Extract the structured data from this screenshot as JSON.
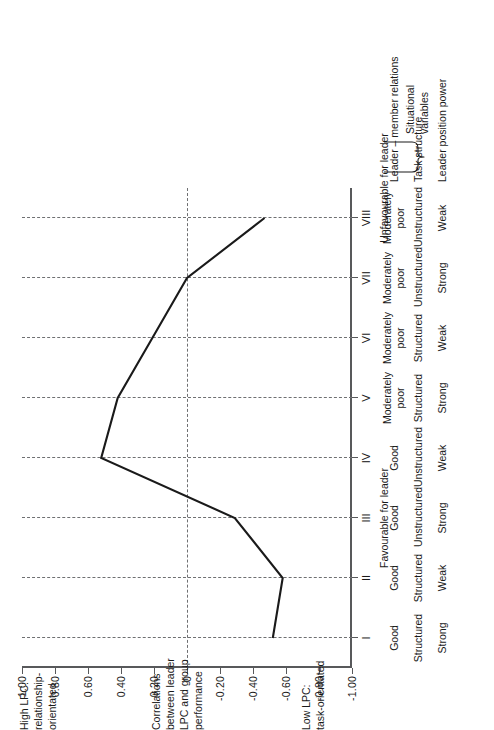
{
  "chart_data": {
    "type": "line",
    "title": "",
    "xlabel": "",
    "ylabel": "Correlations between leader LPC and group performance",
    "categories": [
      "I",
      "II",
      "III",
      "IV",
      "V",
      "VI",
      "VII",
      "VIII"
    ],
    "values": [
      -0.52,
      -0.58,
      -0.29,
      0.52,
      0.42,
      0.21,
      0.0,
      -0.47
    ],
    "ylim": [
      -1.0,
      1.0
    ],
    "grid": true,
    "legend": "none",
    "y_ticks": [
      "1.00",
      "0.80",
      "0.60",
      "0.40",
      "0.20",
      "0",
      "-0.20",
      "-0.40",
      "-0.60",
      "-0.80",
      "-1.00"
    ],
    "y_tick_values": [
      1.0,
      0.8,
      0.6,
      0.4,
      0.2,
      0,
      -0.2,
      -0.4,
      -0.6,
      -0.8,
      -1.0
    ]
  },
  "axis_notes": {
    "high": "High LPC:\nrelationship-\norientated",
    "middle": "Correlations\nbetween leader\nLPC and group\nperformance",
    "low": "Low LPC:\ntask-orientated"
  },
  "regions": [
    {
      "label": "Favourable for leader",
      "center_octant": 2.0
    },
    {
      "label": "Unfavourable for leader",
      "center_octant": 7.5
    }
  ],
  "situational": {
    "title": "Situational\nvariables",
    "rows": [
      {
        "label": "Leader – member relations",
        "cells": [
          "Good",
          "Good",
          "Good",
          "Good",
          "Moderately\npoor",
          "Moderately\npoor",
          "Moderately\npoor",
          "Moderately\npoor"
        ]
      },
      {
        "label": "Task structure",
        "cells": [
          "Structured",
          "Structured",
          "Unstructured",
          "Unstructured",
          "Structured",
          "Structured",
          "Unstructured",
          "Unstructured"
        ]
      },
      {
        "label": "Leader position power",
        "cells": [
          "Strong",
          "Weak",
          "Strong",
          "Weak",
          "Strong",
          "Weak",
          "Strong",
          "Weak"
        ]
      }
    ]
  },
  "colors": {
    "line": "#1a1a1a",
    "axis": "#58595b",
    "grid": "#6f7072",
    "text": "#1a1a1a",
    "background": "#ffffff"
  }
}
